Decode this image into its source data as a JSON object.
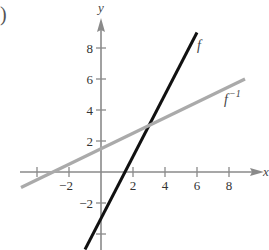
{
  "chart_data": {
    "type": "line",
    "title": "",
    "xlabel": "x",
    "ylabel": "y",
    "xlim": [
      -5.5,
      10.5
    ],
    "ylim": [
      -5,
      10.5
    ],
    "grid": false,
    "x_ticks": [
      -4,
      -2,
      2,
      4,
      6,
      8
    ],
    "x_tick_labels": [
      "",
      "−2",
      "2",
      "4",
      "6",
      "8"
    ],
    "y_ticks": [
      -4,
      -2,
      2,
      4,
      6,
      8
    ],
    "y_tick_labels": [
      "",
      "−2",
      "2",
      "4",
      "6",
      "8"
    ],
    "series": [
      {
        "name": "f",
        "label": "f",
        "expression": "f(x) = 2x - 3",
        "color": "#111111",
        "x": [
          -1,
          6
        ],
        "y": [
          -5,
          9
        ]
      },
      {
        "name": "f inverse",
        "label": "f",
        "label_superscript": "−1",
        "expression": "f^{-1}(x) = (x + 3)/2",
        "color": "#aaaaaa",
        "x": [
          -5,
          9
        ],
        "y": [
          -1,
          6
        ]
      }
    ],
    "annotations": [
      {
        "text": "f",
        "near": [
          6,
          8
        ]
      },
      {
        "text": "f⁻¹",
        "near": [
          8,
          4.5
        ]
      }
    ]
  },
  "figure": {
    "panel_marker": ")"
  }
}
